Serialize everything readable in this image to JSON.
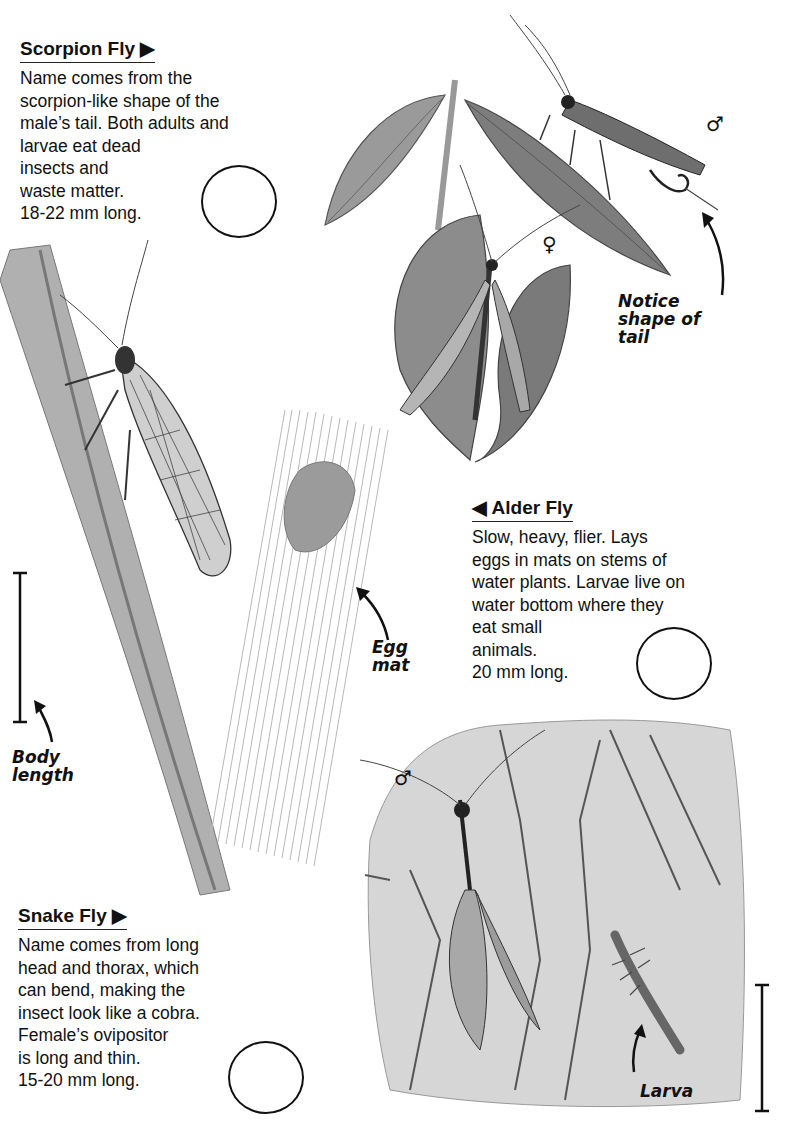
{
  "page": {
    "top_fragment": "(partial line of text cut off at top edge)"
  },
  "sections": [
    {
      "id": "scorpion-fly",
      "heading": "Scorpion Fly ▶",
      "lines": "Name comes from the\nscorpion-like shape of the\nmale’s tail. Both adults and\nlarvae eat dead\ninsects and\nwaste matter.\n18-22 mm long.",
      "size": "18-22 mm long."
    },
    {
      "id": "alder-fly",
      "heading": "◀ Alder Fly",
      "lines": "Slow, heavy, flier. Lays\neggs in mats on stems of\nwater plants. Larvae live on\nwater bottom where they\neat small\nanimals.\n20 mm long.",
      "size": "20 mm long."
    },
    {
      "id": "snake-fly",
      "heading": "Snake Fly ▶",
      "lines": "Name comes from long\nhead and thorax, which\ncan bend, making the\ninsect look like a cobra.\nFemale’s ovipositor\n is long and thin.\n15-20 mm long.",
      "size": "15-20 mm long."
    }
  ],
  "annotations": {
    "notice_tail": "Notice\nshape of\ntail",
    "egg_mat": "Egg\nmat",
    "body_length": "Body\nlength",
    "larva": "Larva",
    "male_symbol": "♂",
    "female_symbol": "♀"
  },
  "icons": {
    "checkbox_circle": "empty-circle",
    "arrow_right": "▶",
    "arrow_left": "◀"
  },
  "colors": {
    "text": "#111111",
    "background": "#ffffff",
    "illustration_dark": "#3a3a3a",
    "illustration_mid": "#8a8a8a",
    "illustration_light": "#cfcfcf"
  }
}
